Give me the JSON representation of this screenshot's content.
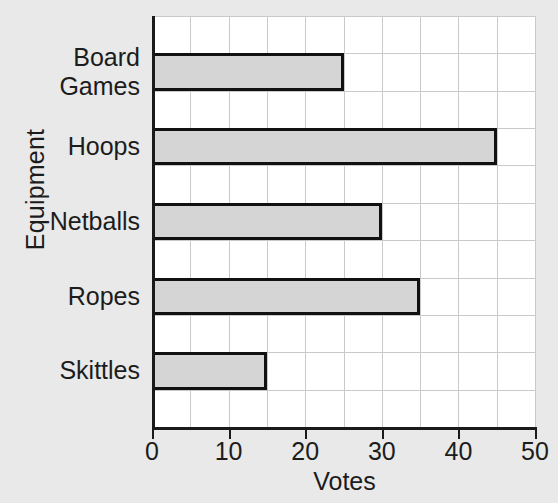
{
  "chart_data": {
    "type": "bar",
    "orientation": "horizontal",
    "title": "",
    "xlabel": "Votes",
    "ylabel": "Equipment",
    "categories": [
      "Board Games",
      "Hoops",
      "Netballs",
      "Ropes",
      "Skittles"
    ],
    "category_display": [
      "Board\nGames",
      "Hoops",
      "Netballs",
      "Ropes",
      "Skittles"
    ],
    "values": [
      25,
      45,
      30,
      35,
      15
    ],
    "xlim": [
      0,
      50
    ],
    "xticks": [
      0,
      10,
      20,
      30,
      40,
      50
    ],
    "xtick_labels": [
      "0",
      "10",
      "20",
      "30",
      "40",
      "50"
    ],
    "minor_gridline_step": 5,
    "grid": true,
    "legend": false,
    "bar_fill_color": "#d5d5d5",
    "bar_edge_color": "#111111",
    "plot_background_color": "#ffffff",
    "page_background_color": "#e9e9e9",
    "gridline_color": "#c9c9c9",
    "axis_color": "#1a1a1a",
    "text_color": "#1c1c1c"
  }
}
